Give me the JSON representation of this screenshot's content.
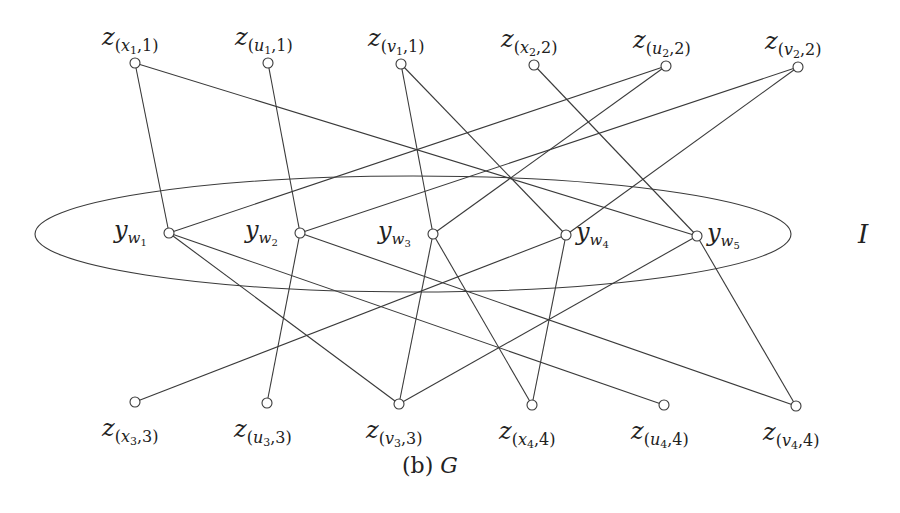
{
  "figure": {
    "caption_prefix": "(b)",
    "caption_graph": "G",
    "set_label": "I"
  },
  "nodes": {
    "top": [
      {
        "id": "z_x1_1",
        "main": "z",
        "var": "x",
        "idx": "1",
        "group": "1",
        "x": 135,
        "y": 63
      },
      {
        "id": "z_u1_1",
        "main": "z",
        "var": "u",
        "idx": "1",
        "group": "1",
        "x": 268,
        "y": 63
      },
      {
        "id": "z_v1_1",
        "main": "z",
        "var": "v",
        "idx": "1",
        "group": "1",
        "x": 401,
        "y": 64
      },
      {
        "id": "z_x2_2",
        "main": "z",
        "var": "x",
        "idx": "2",
        "group": "2",
        "x": 534,
        "y": 65
      },
      {
        "id": "z_u2_2",
        "main": "z",
        "var": "u",
        "idx": "2",
        "group": "2",
        "x": 666,
        "y": 66
      },
      {
        "id": "z_v2_2",
        "main": "z",
        "var": "v",
        "idx": "2",
        "group": "2",
        "x": 798,
        "y": 67
      }
    ],
    "middle": [
      {
        "id": "y_w1",
        "main": "y",
        "var": "w",
        "idx": "1",
        "x": 169,
        "y": 233
      },
      {
        "id": "y_w2",
        "main": "y",
        "var": "w",
        "idx": "2",
        "x": 300,
        "y": 233
      },
      {
        "id": "y_w3",
        "main": "y",
        "var": "w",
        "idx": "3",
        "x": 433,
        "y": 234
      },
      {
        "id": "y_w4",
        "main": "y",
        "var": "w",
        "idx": "4",
        "x": 566,
        "y": 235
      },
      {
        "id": "y_w5",
        "main": "y",
        "var": "w",
        "idx": "5",
        "x": 697,
        "y": 236
      }
    ],
    "bottom": [
      {
        "id": "z_x3_3",
        "main": "z",
        "var": "x",
        "idx": "3",
        "group": "3",
        "x": 135,
        "y": 402
      },
      {
        "id": "z_u3_3",
        "main": "z",
        "var": "u",
        "idx": "3",
        "group": "3",
        "x": 267,
        "y": 403
      },
      {
        "id": "z_v3_3",
        "main": "z",
        "var": "v",
        "idx": "3",
        "group": "3",
        "x": 399,
        "y": 404
      },
      {
        "id": "z_x4_4",
        "main": "z",
        "var": "x",
        "idx": "4",
        "group": "4",
        "x": 532,
        "y": 405
      },
      {
        "id": "z_u4_4",
        "main": "z",
        "var": "u",
        "idx": "4",
        "group": "4",
        "x": 664,
        "y": 405
      },
      {
        "id": "z_v4_4",
        "main": "z",
        "var": "v",
        "idx": "4",
        "group": "4",
        "x": 796,
        "y": 406
      }
    ]
  },
  "edges": [
    [
      "y_w1",
      "z_x1_1"
    ],
    [
      "y_w1",
      "z_u2_2"
    ],
    [
      "y_w1",
      "z_v3_3"
    ],
    [
      "y_w1",
      "z_u4_4"
    ],
    [
      "y_w2",
      "z_u1_1"
    ],
    [
      "y_w2",
      "z_v2_2"
    ],
    [
      "y_w2",
      "z_u3_3"
    ],
    [
      "y_w2",
      "z_v4_4"
    ],
    [
      "y_w3",
      "z_v1_1"
    ],
    [
      "y_w3",
      "z_u2_2"
    ],
    [
      "y_w3",
      "z_v3_3"
    ],
    [
      "y_w3",
      "z_x4_4"
    ],
    [
      "y_w4",
      "z_v1_1"
    ],
    [
      "y_w4",
      "z_v2_2"
    ],
    [
      "y_w4",
      "z_x3_3"
    ],
    [
      "y_w4",
      "z_x4_4"
    ],
    [
      "y_w5",
      "z_x1_1"
    ],
    [
      "y_w5",
      "z_x2_2"
    ],
    [
      "y_w5",
      "z_v3_3"
    ],
    [
      "y_w5",
      "z_v4_4"
    ]
  ],
  "ellipse": {
    "cx": 413,
    "cy": 234,
    "rx": 378,
    "ry": 58
  },
  "colors": {
    "stroke": "#3a3a3a",
    "text": "#222222",
    "background": "#ffffff"
  }
}
